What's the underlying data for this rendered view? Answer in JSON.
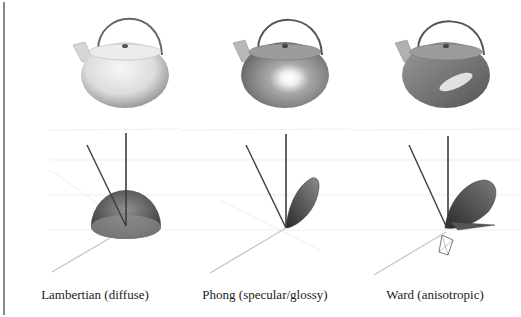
{
  "figure": {
    "panels": [
      {
        "id": "lambertian",
        "caption": "Lambertian (diffuse)",
        "teapot_shading": "matte",
        "lobe_shape": "hemisphere"
      },
      {
        "id": "phong",
        "caption": "Phong (specular/glossy)",
        "teapot_shading": "glossy highlight",
        "lobe_shape": "narrow specular lobe"
      },
      {
        "id": "ward",
        "caption": "Ward (anisotropic)",
        "teapot_shading": "anisotropic elongated highlight",
        "lobe_shape": "anisotropic specular lobe"
      }
    ],
    "colors": {
      "background": "#ffffff",
      "teapot_light": "#e8e8e8",
      "teapot_dark": "#6e6e6e",
      "wireframe": "#3a3a3a",
      "axis_dark": "#3c3c3c",
      "axis_light": "#c8c8c8",
      "left_rule": "#8a8a8a"
    }
  }
}
